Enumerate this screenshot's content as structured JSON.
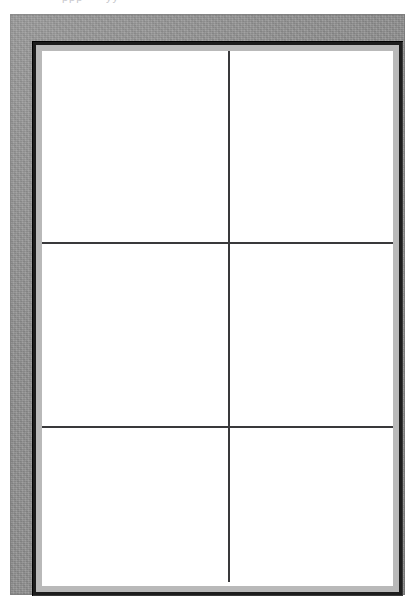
{
  "page": {
    "width": 416,
    "height": 610,
    "background_color": "#ffffff"
  },
  "top_edge": {
    "remnant_text_1": "ppp",
    "remnant_text_2": "yy",
    "note": "clipped descenders of a cut-off caption line"
  },
  "frame": {
    "mat": {
      "label": "",
      "color": "#939393",
      "texture": "speckled-gray",
      "left": 10,
      "top": 14,
      "width": 395,
      "height": 581
    },
    "bevel": {
      "label": "",
      "color": "#1d1d1d",
      "inner_line_color": "#b9b9b9",
      "left": 22,
      "top": 27,
      "width": 371,
      "height": 555
    }
  },
  "grid": {
    "columns": 2,
    "rows": 3,
    "divider_color": "#39393b",
    "divider_thickness": 2,
    "cell_background": "#ffffff",
    "column_split_percent": 53.0,
    "row_split_percent": [
      35.7,
      70.1
    ],
    "cells": [
      {
        "id": "cell-r1-c1",
        "row": 1,
        "column": 1,
        "content": ""
      },
      {
        "id": "cell-r1-c2",
        "row": 1,
        "column": 2,
        "content": ""
      },
      {
        "id": "cell-r2-c1",
        "row": 2,
        "column": 1,
        "content": ""
      },
      {
        "id": "cell-r2-c2",
        "row": 2,
        "column": 2,
        "content": ""
      },
      {
        "id": "cell-r3-c1",
        "row": 3,
        "column": 1,
        "content": ""
      },
      {
        "id": "cell-r3-c2",
        "row": 3,
        "column": 2,
        "content": ""
      }
    ],
    "dividers": {
      "horizontal": [
        {
          "id": "hdiv-1",
          "top_percent": 35.7
        },
        {
          "id": "hdiv-2",
          "top_percent": 70.1
        }
      ],
      "vertical": [
        {
          "id": "vdiv-1",
          "left_percent": 53.0,
          "segment": "row-1"
        },
        {
          "id": "vdiv-2",
          "left_percent": 53.0,
          "segment": "row-2"
        },
        {
          "id": "vdiv-3",
          "left_percent": 53.0,
          "segment": "row-3"
        }
      ]
    }
  }
}
